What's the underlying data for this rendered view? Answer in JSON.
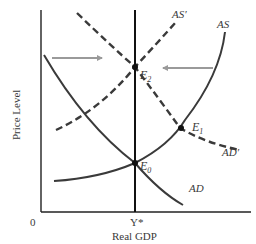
{
  "diagram": {
    "type": "AS-AD economics diagram",
    "axes": {
      "y_label": "Price Level",
      "x_label": "Real GDP",
      "origin_label": "0",
      "x_tick_label": "Y*"
    },
    "curves": {
      "AD": {
        "label": "AD",
        "style": "solid"
      },
      "AS": {
        "label": "AS",
        "style": "solid"
      },
      "AD_prime": {
        "label": "AD′",
        "style": "dashed"
      },
      "AS_prime": {
        "label": "AS′",
        "style": "dashed"
      }
    },
    "points": {
      "E0": {
        "base": "E",
        "sub": "0"
      },
      "E1": {
        "base": "E",
        "sub": "1"
      },
      "E2": {
        "base": "E",
        "sub": "2"
      }
    },
    "arrows": [
      {
        "name": "ad-shift-arrow",
        "direction": "right"
      },
      {
        "name": "as-shift-arrow",
        "direction": "left"
      }
    ],
    "colors": {
      "curve": "#3a3a3a",
      "axis": "#222222",
      "arrow": "#9a9a9a",
      "text": "#3a3a3a"
    }
  }
}
